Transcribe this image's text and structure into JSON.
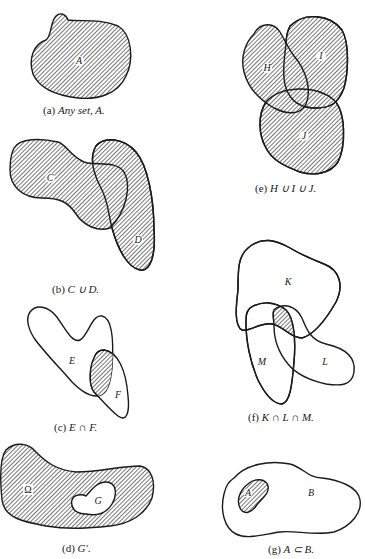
{
  "colors": {
    "ink": "#1a1a1a",
    "background": "#ffffff",
    "hatch": "#555555"
  },
  "panels": [
    {
      "id": "a",
      "caption_prefix": "(a)",
      "caption_text": "Any set, A.",
      "labels": [
        "A"
      ],
      "shaded": "A"
    },
    {
      "id": "b",
      "caption_prefix": "(b)",
      "caption_text": "C ∪ D.",
      "labels": [
        "C",
        "D"
      ],
      "shaded": "union"
    },
    {
      "id": "c",
      "caption_prefix": "(c)",
      "caption_text": "E ∩ F.",
      "labels": [
        "E",
        "F"
      ],
      "shaded": "intersection"
    },
    {
      "id": "d",
      "caption_prefix": "(d)",
      "caption_text": "G′.",
      "labels": [
        "Ω",
        "G"
      ],
      "shaded": "complement of G"
    },
    {
      "id": "e",
      "caption_prefix": "(e)",
      "caption_text": "H ∪ I ∪ J.",
      "labels": [
        "H",
        "I",
        "J"
      ],
      "shaded": "union"
    },
    {
      "id": "f",
      "caption_prefix": "(f)",
      "caption_text": "K ∩ L ∩ M.",
      "labels": [
        "K",
        "L",
        "M"
      ],
      "shaded": "intersection"
    },
    {
      "id": "g",
      "caption_prefix": "(g)",
      "caption_text": "A ⊂ B.",
      "labels": [
        "A",
        "B"
      ],
      "shaded": "A"
    }
  ]
}
